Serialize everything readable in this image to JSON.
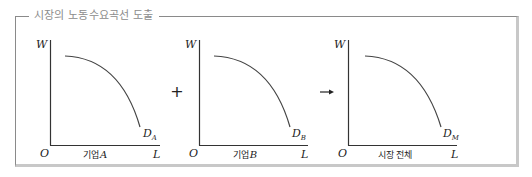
{
  "frame": {
    "title": "시장의 노동수요곡선 도출"
  },
  "operators": {
    "plus": "+",
    "arrow": "→"
  },
  "graphs": [
    {
      "id": "firm-a",
      "y_axis_label": "W",
      "x_axis_label": "L",
      "origin_label": "O",
      "caption_prefix": "기업",
      "caption_var": "A",
      "curve_label_main": "D",
      "curve_label_sub": "A"
    },
    {
      "id": "firm-b",
      "y_axis_label": "W",
      "x_axis_label": "L",
      "origin_label": "O",
      "caption_prefix": "기업",
      "caption_var": "B",
      "curve_label_main": "D",
      "curve_label_sub": "B"
    },
    {
      "id": "market",
      "y_axis_label": "W",
      "x_axis_label": "L",
      "origin_label": "O",
      "caption_prefix": "시장 전체",
      "caption_var": "",
      "curve_label_main": "D",
      "curve_label_sub": "M"
    }
  ],
  "colors": {
    "axis": "#333333",
    "curve": "#444444",
    "text": "#222222",
    "frame_line": "#8a8a8a",
    "frame_shadow": "#c8c8c8",
    "title": "#8c8c8c"
  }
}
